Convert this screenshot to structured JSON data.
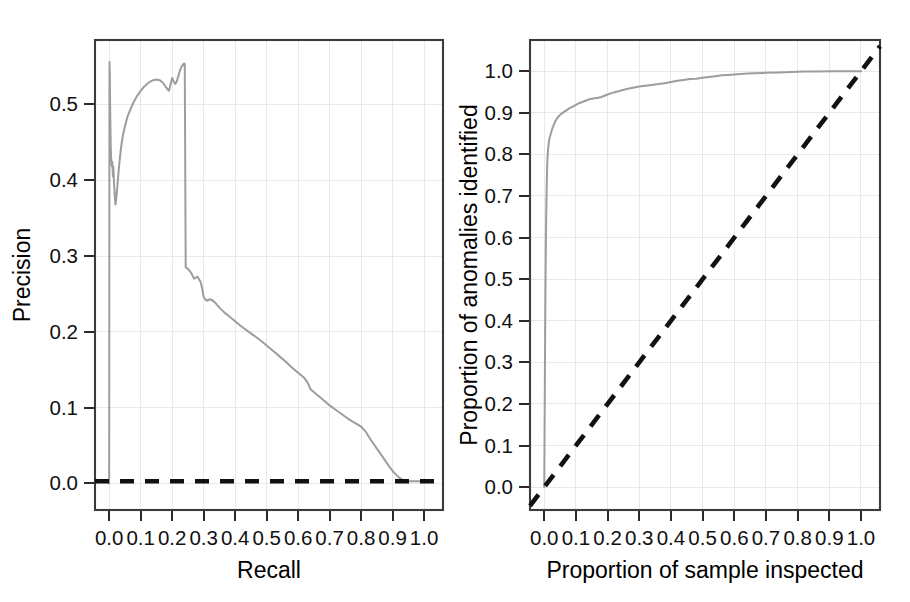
{
  "figure": {
    "background": "#ffffff",
    "curve_color": "#9d9d9d",
    "reference_line_color": "#111111",
    "axis_color": "#3b3b3b",
    "grid_color": "#e9e9e9",
    "panel_count": 2
  },
  "chart_data": [
    {
      "type": "line",
      "id": "precision-recall",
      "title": "",
      "xlabel": "Recall",
      "ylabel": "Precision",
      "xlim": [
        -0.045,
        1.06
      ],
      "ylim": [
        -0.035,
        0.585
      ],
      "xticks": [
        0.0,
        0.1,
        0.2,
        0.3,
        0.4,
        0.5,
        0.6,
        0.7,
        0.8,
        0.9,
        1.0
      ],
      "xticklabels": [
        "0.0",
        "0.1",
        "0.2",
        "0.3",
        "0.4",
        "0.5",
        "0.6",
        "0.7",
        "0.8",
        "0.9",
        "1.0"
      ],
      "yticks": [
        0.0,
        0.1,
        0.2,
        0.3,
        0.4,
        0.5
      ],
      "yticklabels": [
        "0.0",
        "0.1",
        "0.2",
        "0.3",
        "0.4",
        "0.5"
      ],
      "grid": true,
      "legend": "none",
      "series": [
        {
          "name": "Precision-recall curve",
          "style": "solid",
          "color": "#9d9d9d",
          "x": [
            0.0,
            0.001,
            0.002,
            0.003,
            0.004,
            0.005,
            0.006,
            0.007,
            0.008,
            0.009,
            0.01,
            0.011,
            0.012,
            0.013,
            0.014,
            0.015,
            0.016,
            0.017,
            0.018,
            0.019,
            0.02,
            0.022,
            0.024,
            0.026,
            0.028,
            0.03,
            0.033,
            0.036,
            0.04,
            0.045,
            0.05,
            0.055,
            0.06,
            0.07,
            0.08,
            0.09,
            0.1,
            0.11,
            0.12,
            0.13,
            0.14,
            0.15,
            0.16,
            0.17,
            0.18,
            0.19,
            0.195,
            0.2,
            0.205,
            0.21,
            0.215,
            0.22,
            0.225,
            0.23,
            0.235,
            0.238,
            0.24,
            0.241,
            0.242,
            0.243,
            0.25,
            0.26,
            0.27,
            0.28,
            0.29,
            0.295,
            0.3,
            0.305,
            0.31,
            0.32,
            0.33,
            0.34,
            0.35,
            0.36,
            0.37,
            0.38,
            0.4,
            0.42,
            0.44,
            0.46,
            0.48,
            0.5,
            0.52,
            0.54,
            0.56,
            0.58,
            0.6,
            0.62,
            0.63,
            0.64,
            0.66,
            0.68,
            0.7,
            0.72,
            0.74,
            0.76,
            0.78,
            0.8,
            0.815,
            0.83,
            0.85,
            0.87,
            0.89,
            0.905,
            0.92,
            0.93,
            0.94,
            0.95,
            0.96,
            0.975,
            0.99,
            1.0
          ],
          "y": [
            0.0,
            0.556,
            0.54,
            0.5,
            0.47,
            0.445,
            0.43,
            0.425,
            0.42,
            0.418,
            0.424,
            0.415,
            0.405,
            0.418,
            0.412,
            0.4,
            0.392,
            0.386,
            0.378,
            0.372,
            0.368,
            0.374,
            0.382,
            0.392,
            0.402,
            0.412,
            0.425,
            0.437,
            0.45,
            0.462,
            0.471,
            0.479,
            0.486,
            0.496,
            0.505,
            0.512,
            0.518,
            0.523,
            0.527,
            0.53,
            0.532,
            0.533,
            0.532,
            0.529,
            0.523,
            0.518,
            0.527,
            0.535,
            0.53,
            0.527,
            0.531,
            0.538,
            0.545,
            0.55,
            0.553,
            0.554,
            0.553,
            0.47,
            0.37,
            0.285,
            0.283,
            0.278,
            0.27,
            0.273,
            0.266,
            0.258,
            0.246,
            0.243,
            0.241,
            0.243,
            0.241,
            0.237,
            0.232,
            0.228,
            0.224,
            0.221,
            0.214,
            0.207,
            0.201,
            0.195,
            0.189,
            0.182,
            0.175,
            0.168,
            0.161,
            0.153,
            0.146,
            0.139,
            0.133,
            0.124,
            0.117,
            0.11,
            0.103,
            0.097,
            0.091,
            0.085,
            0.08,
            0.075,
            0.068,
            0.058,
            0.046,
            0.034,
            0.022,
            0.014,
            0.008,
            0.005,
            0.004,
            0.003,
            0.003,
            0.003,
            0.003,
            0.003
          ]
        },
        {
          "name": "Baseline",
          "style": "dashed",
          "color": "#111111",
          "x": [
            -0.045,
            1.06
          ],
          "y": [
            0.003,
            0.003
          ]
        }
      ]
    },
    {
      "type": "line",
      "id": "cumulative-detection",
      "title": "",
      "xlabel": "Proportion of sample inspected",
      "ylabel": "Proportion of anomalies identified",
      "xlim": [
        -0.045,
        1.06
      ],
      "ylim": [
        -0.055,
        1.075
      ],
      "xticks": [
        0.0,
        0.1,
        0.2,
        0.3,
        0.4,
        0.5,
        0.6,
        0.7,
        0.8,
        0.9,
        1.0
      ],
      "xticklabels": [
        "0.0",
        "0.1",
        "0.2",
        "0.3",
        "0.4",
        "0.5",
        "0.6",
        "0.7",
        "0.8",
        "0.9",
        "1.0"
      ],
      "yticks": [
        0.0,
        0.1,
        0.2,
        0.3,
        0.4,
        0.5,
        0.6,
        0.7,
        0.8,
        0.9,
        1.0
      ],
      "yticklabels": [
        "0.0",
        "0.1",
        "0.2",
        "0.3",
        "0.4",
        "0.5",
        "0.6",
        "0.7",
        "0.8",
        "0.9",
        "1.0"
      ],
      "grid": true,
      "legend": "none",
      "series": [
        {
          "name": "Detection curve",
          "style": "solid",
          "color": "#9d9d9d",
          "x": [
            0.0,
            0.0005,
            0.001,
            0.0015,
            0.002,
            0.0025,
            0.003,
            0.0035,
            0.004,
            0.0045,
            0.005,
            0.006,
            0.007,
            0.008,
            0.009,
            0.01,
            0.012,
            0.014,
            0.016,
            0.018,
            0.02,
            0.023,
            0.026,
            0.03,
            0.035,
            0.04,
            0.045,
            0.05,
            0.055,
            0.06,
            0.07,
            0.08,
            0.09,
            0.1,
            0.11,
            0.12,
            0.13,
            0.14,
            0.15,
            0.16,
            0.17,
            0.18,
            0.19,
            0.2,
            0.22,
            0.24,
            0.26,
            0.28,
            0.3,
            0.32,
            0.34,
            0.36,
            0.38,
            0.4,
            0.42,
            0.44,
            0.46,
            0.48,
            0.5,
            0.52,
            0.54,
            0.56,
            0.58,
            0.6,
            0.63,
            0.66,
            0.7,
            0.74,
            0.78,
            0.82,
            0.86,
            0.9,
            0.94,
            0.97,
            1.0
          ],
          "y": [
            0.0,
            0.06,
            0.13,
            0.2,
            0.265,
            0.33,
            0.39,
            0.445,
            0.495,
            0.54,
            0.58,
            0.64,
            0.69,
            0.73,
            0.762,
            0.788,
            0.812,
            0.826,
            0.836,
            0.843,
            0.848,
            0.856,
            0.863,
            0.871,
            0.88,
            0.886,
            0.891,
            0.895,
            0.898,
            0.901,
            0.906,
            0.911,
            0.915,
            0.919,
            0.923,
            0.926,
            0.929,
            0.932,
            0.934,
            0.935,
            0.936,
            0.938,
            0.941,
            0.944,
            0.949,
            0.953,
            0.957,
            0.96,
            0.963,
            0.965,
            0.967,
            0.969,
            0.971,
            0.974,
            0.977,
            0.979,
            0.981,
            0.982,
            0.984,
            0.986,
            0.988,
            0.99,
            0.991,
            0.992,
            0.994,
            0.995,
            0.996,
            0.997,
            0.998,
            0.999,
            0.999,
            1.0,
            1.0,
            1.0,
            1.0
          ]
        },
        {
          "name": "Random baseline",
          "style": "dashed",
          "color": "#111111",
          "x": [
            -0.045,
            1.06
          ],
          "y": [
            -0.045,
            1.06
          ]
        }
      ]
    }
  ]
}
